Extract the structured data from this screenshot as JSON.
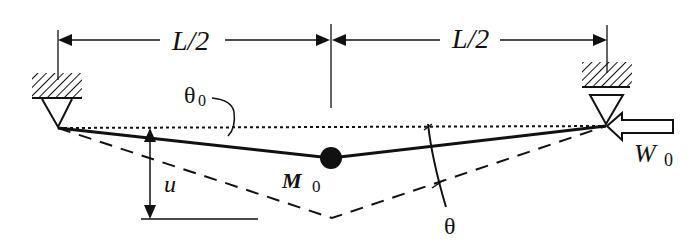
{
  "diagram": {
    "type": "beam-with-central-mass",
    "labels": {
      "left_span": "L/2",
      "right_span": "L/2",
      "theta0": "θ",
      "theta0_sub": "0",
      "theta": "θ",
      "u": "u",
      "mass": "M",
      "mass_sub": "0",
      "load": "W",
      "load_sub": "0"
    },
    "elements": [
      {
        "name": "left-pin-support"
      },
      {
        "name": "right-pin-support"
      },
      {
        "name": "undeformed-reference-line",
        "style": "dotted"
      },
      {
        "name": "deflected-beam",
        "style": "solid"
      },
      {
        "name": "initial-shape",
        "style": "dashed"
      },
      {
        "name": "central-mass"
      },
      {
        "name": "axial-load-arrow",
        "direction": "left"
      }
    ],
    "colors": {
      "ink": "#111111",
      "background": "#ffffff"
    }
  }
}
